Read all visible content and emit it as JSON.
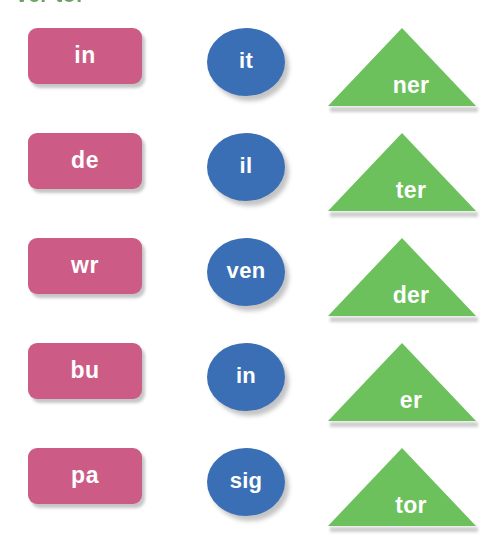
{
  "header": {
    "clipped_text": "ver tor"
  },
  "colors": {
    "background": "#ffffff",
    "rect_fill": "#cc5c85",
    "ellipse_fill": "#3a6fb5",
    "triangle_fill": "#6cc15c",
    "label_text": "#ffffff",
    "header_text": "#5f9e57",
    "shadow": "#828282"
  },
  "board": {
    "columns": [
      {
        "shape": "rounded-rectangle",
        "color_name": "pink"
      },
      {
        "shape": "ellipse",
        "color_name": "blue"
      },
      {
        "shape": "triangle",
        "color_name": "green"
      }
    ],
    "rows": [
      {
        "rect": "in",
        "ellipse": "it",
        "triangle": "ner"
      },
      {
        "rect": "de",
        "ellipse": "il",
        "triangle": "ter"
      },
      {
        "rect": "wr",
        "ellipse": "ven",
        "triangle": "der"
      },
      {
        "rect": "bu",
        "ellipse": "in",
        "triangle": "er"
      },
      {
        "rect": "pa",
        "ellipse": "sig",
        "triangle": "tor"
      }
    ]
  }
}
